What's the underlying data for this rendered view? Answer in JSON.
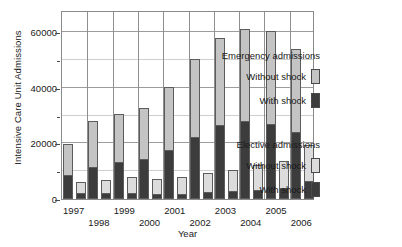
{
  "chart_data": {
    "type": "bar",
    "title": "",
    "xlabel": "Year",
    "ylabel": "Intensive Care Unit Admissions",
    "ylim": [
      0,
      68000
    ],
    "yticks": [
      0,
      20000,
      40000,
      60000
    ],
    "yticks_minor": [
      10000,
      30000,
      50000
    ],
    "grid": true,
    "legend_position": "right",
    "categories": [
      "1997",
      "1998",
      "1999",
      "2000",
      "2001",
      "2002",
      "2003",
      "2004",
      "2005",
      "2006"
    ],
    "series": [
      {
        "name": "Emergency admissions - With shock",
        "group": "Emergency admissions",
        "stack_part": "With shock",
        "color": "#3c3c3c",
        "values": [
          8500,
          11400,
          13200,
          14400,
          17600,
          22200,
          26500,
          28000,
          27000,
          24200
        ]
      },
      {
        "name": "Emergency admissions - Without shock",
        "group": "Emergency admissions",
        "stack_part": "Without shock",
        "color": "#c4c4c4",
        "values": [
          11400,
          16600,
          17500,
          18300,
          22600,
          28000,
          31500,
          33200,
          33500,
          29800
        ]
      },
      {
        "name": "Elective admissions - With shock",
        "group": "Elective admissions",
        "stack_part": "With shock",
        "color": "#3c3c3c",
        "values": [
          1900,
          1900,
          1900,
          1700,
          1600,
          2400,
          2800,
          3100,
          3700,
          6200
        ]
      },
      {
        "name": "Elective admissions - Without shock",
        "group": "Elective admissions",
        "stack_part": "Without shock",
        "color": "#dcdcdc",
        "values": [
          4400,
          5100,
          5900,
          5500,
          6300,
          7100,
          7800,
          9200,
          9800,
          13300
        ]
      }
    ],
    "totals_emergency": [
      19900,
      28000,
      30700,
      32700,
      40200,
      50200,
      58000,
      61200,
      60500,
      54000
    ],
    "totals_elective": [
      6300,
      7000,
      7800,
      7200,
      7900,
      9500,
      10600,
      12300,
      13500,
      19500
    ]
  },
  "axes": {
    "y_title": "Intensive Care Unit Admissions",
    "x_title": "Year",
    "y_tick_labels": [
      "0",
      "20000",
      "40000",
      "60000"
    ],
    "x_tick_labels": [
      "1997",
      "1998",
      "1999",
      "2000",
      "2001",
      "2002",
      "2003",
      "2004",
      "2005",
      "2006"
    ]
  },
  "legend": {
    "emergency": {
      "title": "Emergency admissions",
      "rows": [
        {
          "label": "Without shock",
          "swatch": "light-emergency"
        },
        {
          "label": "With shock",
          "swatch": "dark"
        }
      ]
    },
    "elective": {
      "title": "Elective admissions",
      "rows": [
        {
          "label": "Without shock",
          "swatch": "light-elective"
        },
        {
          "label": "With shock",
          "swatch": "dark"
        }
      ]
    }
  },
  "colors": {
    "dark_shock": "#3c3c3c",
    "light_emergency": "#c4c4c4",
    "light_elective": "#dcdcdc",
    "frame": "#8a8a8a",
    "grid_major": "#9c9c9c",
    "grid_minor": "#cfcfcf"
  }
}
